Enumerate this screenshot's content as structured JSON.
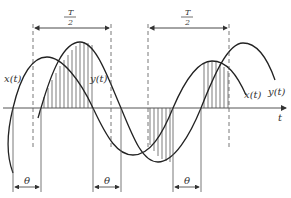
{
  "diagram": {
    "title": "",
    "axis": {
      "t_label": "t"
    },
    "curves": [
      {
        "name": "x(t)",
        "label_left": "x(t)",
        "label_right": "x(t)"
      },
      {
        "name": "y(t)",
        "label_left": "y(t)",
        "label_right": "y(t)"
      }
    ],
    "interval_labels": {
      "half_period_numerator": "T",
      "half_period_denominator": "2",
      "phase_shift": "θ"
    },
    "colors": {
      "line": "#222222",
      "axis": "#555555",
      "hatch": "#444444",
      "background": "#ffffff"
    }
  }
}
